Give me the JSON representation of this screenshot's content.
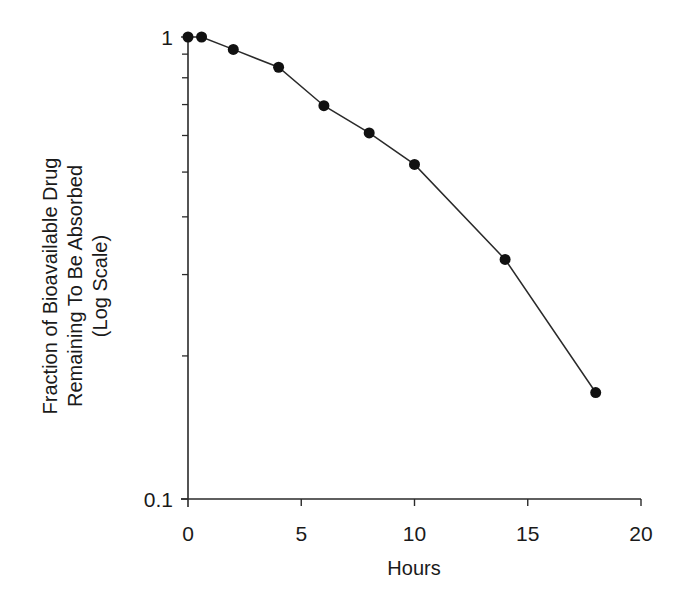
{
  "chart_data": {
    "type": "line",
    "title": "",
    "xlabel": "Hours",
    "ylabel": [
      "Fraction of Bioavailable Drug",
      "Remaining To Be Absorbed",
      "(Log Scale)"
    ],
    "xlim": [
      0,
      20
    ],
    "ylim": [
      0.1,
      1
    ],
    "yscale": "log",
    "x_ticks": [
      0,
      5,
      10,
      15,
      20
    ],
    "x_tick_labels": [
      "0",
      "5",
      "10",
      "15",
      "20"
    ],
    "y_ticks": [
      0.1,
      1
    ],
    "y_tick_labels": [
      "0.1",
      "1"
    ],
    "y_minor_ticks": [
      0.2,
      0.3,
      0.4,
      0.5,
      0.6,
      0.7,
      0.8,
      0.9
    ],
    "grid": false,
    "legend": null,
    "series": [
      {
        "name": "Fraction remaining",
        "marker": "filled-circle",
        "color": "#1a1a1a",
        "x": [
          0,
          0.6,
          2,
          4,
          6,
          8,
          10,
          14,
          18
        ],
        "y": [
          1.0,
          1.0,
          0.94,
          0.86,
          0.71,
          0.62,
          0.53,
          0.33,
          0.17
        ]
      }
    ]
  },
  "colors": {
    "axis": "#2a2a2a",
    "line": "#2a2a2a",
    "marker": "#111111"
  }
}
